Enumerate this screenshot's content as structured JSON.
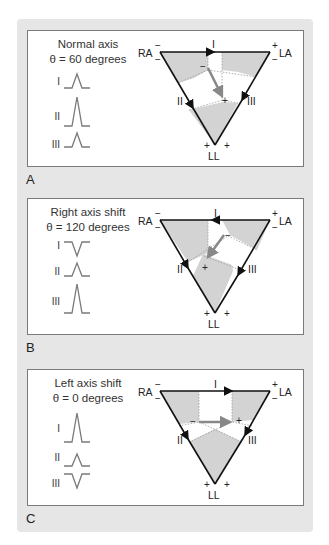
{
  "figure": {
    "panels": [
      {
        "letter": "A",
        "title_line1": "Normal axis",
        "title_line2": "θ = 60 degrees",
        "leads": [
          {
            "label": "I",
            "deflection": "positive",
            "amplitude": "small"
          },
          {
            "label": "II",
            "deflection": "positive",
            "amplitude": "large"
          },
          {
            "label": "III",
            "deflection": "positive",
            "amplitude": "small"
          }
        ],
        "triangle": {
          "vertices": {
            "right_arm": "RA",
            "left_arm": "LA",
            "left_leg": "LL"
          },
          "sides": {
            "top": "I",
            "left": "II",
            "right": "III"
          },
          "lead_I_arrow": "right",
          "axis_angle_degrees": 60
        }
      },
      {
        "letter": "B",
        "title_line1": "Right axis shift",
        "title_line2": "θ = 120 degrees",
        "leads": [
          {
            "label": "I",
            "deflection": "negative",
            "amplitude": "small"
          },
          {
            "label": "II",
            "deflection": "positive",
            "amplitude": "small"
          },
          {
            "label": "III",
            "deflection": "positive",
            "amplitude": "large"
          }
        ],
        "triangle": {
          "vertices": {
            "right_arm": "RA",
            "left_arm": "LA",
            "left_leg": "LL"
          },
          "sides": {
            "top": "I",
            "left": "II",
            "right": "III"
          },
          "lead_I_arrow": "left",
          "axis_angle_degrees": 120
        }
      },
      {
        "letter": "C",
        "title_line1": "Left axis shift",
        "title_line2": "θ = 0 degrees",
        "leads": [
          {
            "label": "I",
            "deflection": "positive",
            "amplitude": "large"
          },
          {
            "label": "II",
            "deflection": "positive",
            "amplitude": "small"
          },
          {
            "label": "III",
            "deflection": "negative",
            "amplitude": "small"
          }
        ],
        "triangle": {
          "vertices": {
            "right_arm": "RA",
            "left_arm": "LA",
            "left_leg": "LL"
          },
          "sides": {
            "top": "I",
            "left": "II",
            "right": "III"
          },
          "lead_I_arrow": "right",
          "axis_angle_degrees": 0
        }
      }
    ],
    "signs": {
      "plus": "+",
      "minus": "−"
    },
    "colors": {
      "background": "#e6e6e6",
      "shading": "#d3d3d3",
      "line": "#111111",
      "trace": "#7a7a7a",
      "axis_arrow": "#8a8a8a"
    }
  }
}
